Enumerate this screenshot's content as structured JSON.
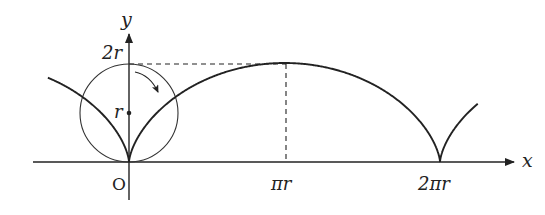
{
  "diagram": {
    "axes": {
      "x_label": "x",
      "y_label": "y",
      "origin_label": "O"
    },
    "y_ticks": [
      {
        "label": "2r",
        "value": "2r"
      },
      {
        "label": "r",
        "value": "r"
      }
    ],
    "x_ticks": [
      {
        "label": "πr",
        "value": "πr"
      },
      {
        "label": "2πr",
        "value": "2πr"
      }
    ],
    "elements": [
      {
        "type": "circle",
        "description": "rolling circle at origin",
        "center": "(0, r)",
        "radius": "r"
      },
      {
        "type": "curve",
        "description": "cycloid arch from 0 to 2πr",
        "peak": "(πr, 2r)"
      },
      {
        "type": "dashed-line",
        "description": "horizontal from (0,2r) to (πr,2r)"
      },
      {
        "type": "dashed-line",
        "description": "vertical from (πr,2r) to (πr,0)"
      },
      {
        "type": "arrow",
        "description": "clockwise rotation arrow inside circle"
      },
      {
        "type": "point",
        "description": "circle center",
        "at": "(0, r)"
      }
    ],
    "colors": {
      "stroke": "#222222",
      "background": "#ffffff"
    }
  }
}
